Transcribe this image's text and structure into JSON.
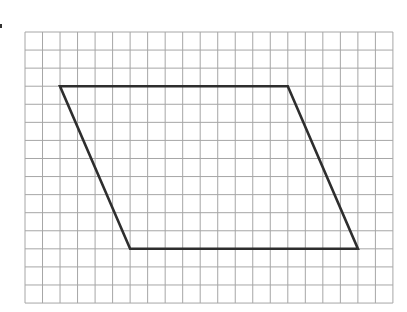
{
  "figure": {
    "type": "grid-diagram",
    "grid": {
      "columns": 21,
      "rows": 15,
      "origin_px": [
        25,
        32
      ],
      "cell_w_px": 17.52,
      "cell_h_px": 18.07,
      "line_color": "#a6a6a6"
    },
    "shape": {
      "name": "parallelogram",
      "stroke_color": "#2e2e2e",
      "stroke_width": 2.6,
      "vertices_grid": [
        [
          2,
          3
        ],
        [
          15,
          3
        ],
        [
          19,
          12
        ],
        [
          6,
          12
        ]
      ],
      "top_side_length_units": 13,
      "bottom_side_length_units": 13,
      "height_units": 9
    }
  }
}
